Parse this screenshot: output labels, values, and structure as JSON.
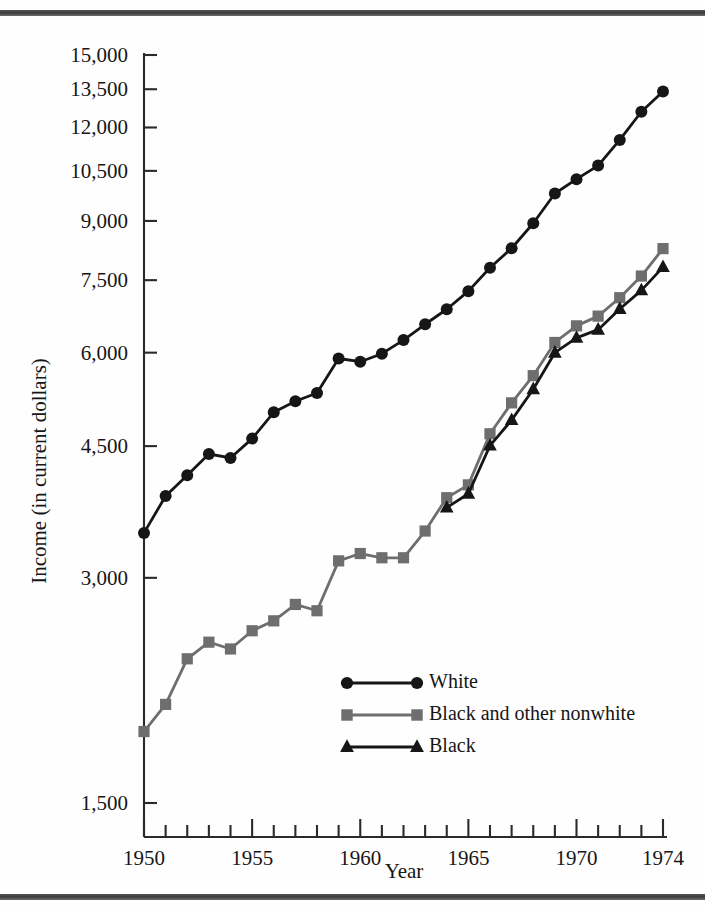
{
  "figure": {
    "background_color": "#fefefe",
    "rule_color": "#4a4a4a",
    "axis_color": "#2a2a2a"
  },
  "chart_data": {
    "type": "line",
    "title": "",
    "subtitle": "",
    "xlabel": "Year",
    "ylabel": "Income (in current dollars)",
    "yscale": "log",
    "xlim": [
      1950,
      1974
    ],
    "ylim": [
      1500,
      15000
    ],
    "grid": false,
    "legend_position": "inside-center-lower",
    "x_tick_labels": [
      "1950",
      "1955",
      "1960",
      "1965",
      "1970",
      "1974"
    ],
    "x_tick_values": [
      1950,
      1955,
      1960,
      1965,
      1970,
      1974
    ],
    "x_minor_ticks": [
      1951,
      1952,
      1953,
      1954,
      1956,
      1957,
      1958,
      1959,
      1961,
      1962,
      1963,
      1964,
      1966,
      1967,
      1968,
      1969,
      1971,
      1972,
      1973
    ],
    "y_tick_labels": [
      "15,000",
      "13,500",
      "12,000",
      "10,500",
      "9,000",
      "7,500",
      "6,000",
      "4,500",
      "3,000",
      "1,500"
    ],
    "y_tick_values": [
      15000,
      13500,
      12000,
      10500,
      9000,
      7500,
      6000,
      4500,
      3000,
      1500
    ],
    "x": [
      1950,
      1951,
      1952,
      1953,
      1954,
      1955,
      1956,
      1957,
      1958,
      1959,
      1960,
      1961,
      1962,
      1963,
      1964,
      1965,
      1966,
      1967,
      1968,
      1969,
      1970,
      1971,
      1972,
      1973,
      1974
    ],
    "series": [
      {
        "name": "White",
        "marker": "circle",
        "color": "#161616",
        "line_color": "#161616",
        "x": [
          1950,
          1951,
          1952,
          1953,
          1954,
          1955,
          1956,
          1957,
          1958,
          1959,
          1960,
          1961,
          1962,
          1963,
          1964,
          1965,
          1966,
          1967,
          1968,
          1969,
          1970,
          1971,
          1972,
          1973,
          1974
        ],
        "values": [
          3445,
          3859,
          4114,
          4392,
          4339,
          4605,
          4993,
          5166,
          5300,
          5893,
          5835,
          5981,
          6237,
          6548,
          6858,
          7251,
          7792,
          8274,
          8937,
          9794,
          10236,
          10672,
          11549,
          12595,
          13408
        ]
      },
      {
        "name": "Black and other nonwhite",
        "marker": "square",
        "color": "#6e6e6e",
        "line_color": "#6e6e6e",
        "x": [
          1950,
          1951,
          1952,
          1953,
          1954,
          1955,
          1956,
          1957,
          1958,
          1959,
          1960,
          1961,
          1962,
          1963,
          1964,
          1965,
          1966,
          1967,
          1968,
          1969,
          1970,
          1971,
          1972,
          1973,
          1974
        ],
        "values": [
          1869,
          2032,
          2338,
          2461,
          2410,
          2549,
          2628,
          2764,
          2711,
          3161,
          3233,
          3191,
          3191,
          3465,
          3839,
          3994,
          4674,
          5141,
          5590,
          6191,
          6516,
          6714,
          7106,
          7596,
          8265
        ]
      },
      {
        "name": "Black",
        "marker": "triangle",
        "color": "#161616",
        "line_color": "#161616",
        "x": [
          1964,
          1965,
          1966,
          1967,
          1968,
          1969,
          1970,
          1971,
          1972,
          1973,
          1974
        ],
        "values": [
          3724,
          3886,
          4507,
          4875,
          5360,
          5999,
          6279,
          6440,
          6864,
          7269,
          7808
        ]
      }
    ]
  },
  "legend": {
    "entries": [
      {
        "label": "White",
        "marker": "circle",
        "color": "#161616"
      },
      {
        "label": "Black and other nonwhite",
        "marker": "square",
        "color": "#6e6e6e"
      },
      {
        "label": "Black",
        "marker": "triangle",
        "color": "#161616"
      }
    ]
  }
}
